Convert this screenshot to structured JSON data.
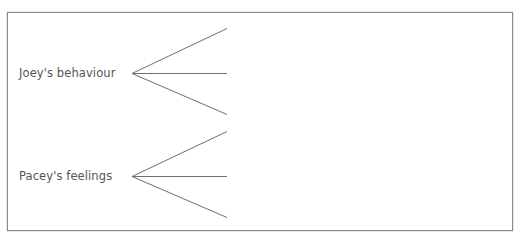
{
  "diagram": {
    "trees": [
      {
        "label": "Joey's behaviour",
        "label_pos": {
          "x": 19,
          "y": 66
        },
        "vertex": {
          "x": 132,
          "y": 73
        },
        "branch_ends": [
          {
            "x": 227,
            "y": 28
          },
          {
            "x": 227,
            "y": 73
          },
          {
            "x": 227,
            "y": 114
          }
        ]
      },
      {
        "label": "Pacey's feelings",
        "label_pos": {
          "x": 19,
          "y": 169
        },
        "vertex": {
          "x": 132,
          "y": 176
        },
        "branch_ends": [
          {
            "x": 227,
            "y": 131
          },
          {
            "x": 227,
            "y": 176
          },
          {
            "x": 227,
            "y": 217
          }
        ]
      }
    ],
    "colors": {
      "line": "#6f6f6f",
      "text": "#555555",
      "border": "#8a8a8a"
    }
  }
}
